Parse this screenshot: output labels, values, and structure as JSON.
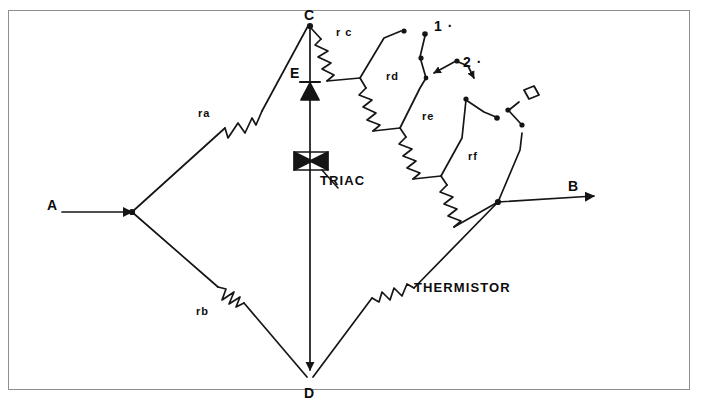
{
  "figure": {
    "type": "circuit-diagram",
    "frame_color": "#8e8e8e",
    "line_color": "#151515",
    "background": "#ffffff"
  },
  "nodes": [
    {
      "id": "A",
      "label": "A",
      "x": 50,
      "y": 206,
      "role": "input-terminal-left"
    },
    {
      "id": "B",
      "label": "B",
      "x": 572,
      "y": 187,
      "role": "output-terminal-right"
    },
    {
      "id": "C",
      "label": "C",
      "x": 310,
      "y": 18,
      "role": "bridge-top-node"
    },
    {
      "id": "D",
      "label": "D",
      "x": 310,
      "y": 394,
      "role": "bridge-bottom-node"
    }
  ],
  "components": [
    {
      "id": "ra",
      "label": "ra",
      "type": "resistor",
      "label_x": 202,
      "label_y": 114
    },
    {
      "id": "rb",
      "label": "rb",
      "type": "resistor",
      "label_x": 200,
      "label_y": 312
    },
    {
      "id": "rc",
      "label": "r c",
      "type": "resistor",
      "label_x": 338,
      "label_y": 33
    },
    {
      "id": "rd",
      "label": "rd",
      "type": "resistor",
      "label_x": 388,
      "label_y": 77
    },
    {
      "id": "re",
      "label": "re",
      "type": "resistor",
      "label_x": 424,
      "label_y": 117
    },
    {
      "id": "rf",
      "label": "rf",
      "type": "resistor",
      "label_x": 470,
      "label_y": 157
    },
    {
      "id": "thermistor",
      "label": "THERMISTOR",
      "type": "thermistor",
      "label_x": 414,
      "label_y": 287
    },
    {
      "id": "triac",
      "label": "TRIAC",
      "type": "triac",
      "label_x": 320,
      "label_y": 180
    },
    {
      "id": "diac",
      "label": "E",
      "type": "diac-diode",
      "label_x": 293,
      "label_y": 73
    }
  ],
  "switch_labels": [
    {
      "id": "sw1",
      "label": "1 ·",
      "x": 437,
      "y": 26
    },
    {
      "id": "sw2",
      "label": "2 ·",
      "x": 466,
      "y": 62
    }
  ]
}
